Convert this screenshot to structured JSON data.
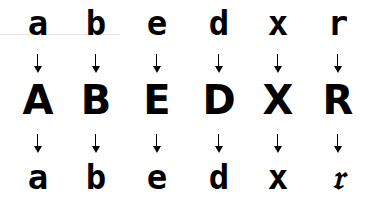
{
  "diagram": {
    "columns": [
      {
        "top": "a",
        "middle": "A",
        "bottom": "a",
        "x": 38
      },
      {
        "top": "b",
        "middle": "B",
        "bottom": "b",
        "x": 96
      },
      {
        "top": "e",
        "middle": "E",
        "bottom": "e",
        "x": 157
      },
      {
        "top": "d",
        "middle": "D",
        "bottom": "d",
        "x": 219
      },
      {
        "top": "x",
        "middle": "X",
        "bottom": "x",
        "x": 278
      },
      {
        "top": "r",
        "middle": "R",
        "bottom": "𝔯",
        "x": 338
      }
    ],
    "arrow_symbol": "down-arrow-icon",
    "rows": {
      "top": "lowercase input glyphs",
      "middle": "uppercase glyphs",
      "bottom": "lowercase output glyphs"
    },
    "colors": {
      "foreground": "#000000",
      "background": "#ffffff"
    }
  }
}
